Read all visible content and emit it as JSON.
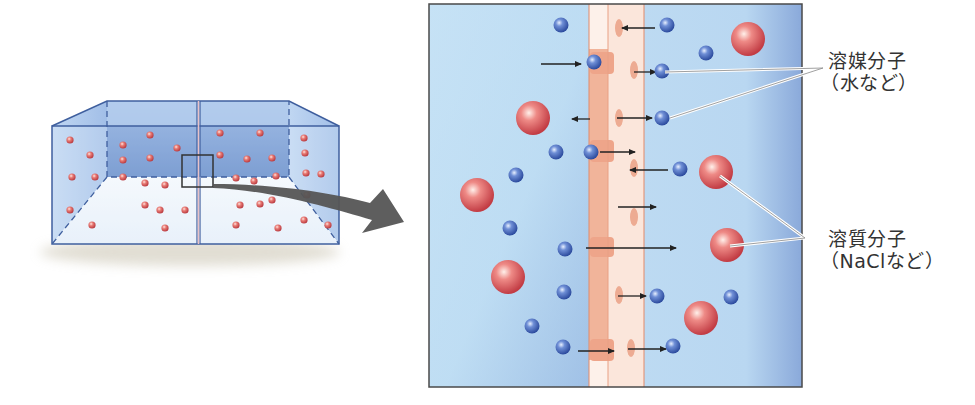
{
  "colors": {
    "water_light": "#c8e3f5",
    "water_dark": "#7fa8d8",
    "tank_back": "#6f95cf",
    "tank_edge": "#3f5f9e",
    "membrane_outer": "#f2b79e",
    "membrane_inner": "#fbe3d6",
    "membrane_pore": "#e89779",
    "solvent": "#3f63b8",
    "solute": "#d9545a",
    "arrow": "#222222",
    "callout_arrow": "#555555",
    "leader": "#ffffff",
    "frame": "#4a4a4a"
  },
  "labels": {
    "solvent": {
      "line1": "溶媒分子",
      "line2": "（水など）"
    },
    "solute": {
      "line1": "溶質分子",
      "line2": "（NaClなど）"
    }
  },
  "tank": {
    "dots": [
      [
        70,
        140
      ],
      [
        90,
        155
      ],
      [
        72,
        177
      ],
      [
        95,
        177
      ],
      [
        70,
        210
      ],
      [
        92,
        225
      ],
      [
        123,
        145
      ],
      [
        150,
        135
      ],
      [
        177,
        148
      ],
      [
        123,
        160
      ],
      [
        150,
        158
      ],
      [
        123,
        177
      ],
      [
        145,
        183
      ],
      [
        165,
        185
      ],
      [
        145,
        205
      ],
      [
        160,
        210
      ],
      [
        185,
        210
      ],
      [
        165,
        228
      ],
      [
        220,
        133
      ],
      [
        260,
        133
      ],
      [
        220,
        155
      ],
      [
        247,
        159
      ],
      [
        272,
        158
      ],
      [
        236,
        178
      ],
      [
        254,
        181
      ],
      [
        276,
        176
      ],
      [
        240,
        205
      ],
      [
        260,
        204
      ],
      [
        272,
        200
      ],
      [
        236,
        225
      ],
      [
        278,
        228
      ],
      [
        304,
        138
      ],
      [
        305,
        153
      ],
      [
        306,
        173
      ],
      [
        321,
        174
      ],
      [
        307,
        195
      ],
      [
        304,
        220
      ],
      [
        328,
        225
      ]
    ]
  },
  "zoom_panel": {
    "solvent_molecules": [
      [
        561,
        25
      ],
      [
        667,
        25
      ],
      [
        706,
        53
      ],
      [
        594,
        62
      ],
      [
        662,
        71
      ],
      [
        662,
        118
      ],
      [
        556,
        152
      ],
      [
        591,
        152
      ],
      [
        680,
        169
      ],
      [
        516,
        175
      ],
      [
        510,
        228
      ],
      [
        565,
        249
      ],
      [
        564,
        292
      ],
      [
        657,
        296
      ],
      [
        731,
        297
      ],
      [
        532,
        326
      ],
      [
        563,
        347
      ],
      [
        673,
        346
      ]
    ],
    "solute_molecules": [
      [
        748,
        39
      ],
      [
        533,
        118
      ],
      [
        716,
        172
      ],
      [
        477,
        195
      ],
      [
        727,
        245
      ],
      [
        508,
        277
      ],
      [
        701,
        318
      ]
    ],
    "arrows": [
      [
        655,
        28,
        622,
        28
      ],
      [
        541,
        64,
        581,
        64
      ],
      [
        634,
        72,
        656,
        72
      ],
      [
        590,
        119,
        572,
        119
      ],
      [
        617,
        118,
        652,
        118
      ],
      [
        600,
        152,
        635,
        152
      ],
      [
        668,
        170,
        630,
        170
      ],
      [
        618,
        207,
        656,
        207
      ],
      [
        586,
        248,
        676,
        248
      ],
      [
        618,
        296,
        646,
        296
      ],
      [
        578,
        351,
        614,
        351
      ],
      [
        628,
        349,
        666,
        349
      ]
    ],
    "pores": [
      [
        619,
        28
      ],
      [
        634,
        70
      ],
      [
        619,
        118
      ],
      [
        634,
        168
      ],
      [
        634,
        217
      ],
      [
        619,
        295
      ],
      [
        631,
        348
      ]
    ]
  }
}
